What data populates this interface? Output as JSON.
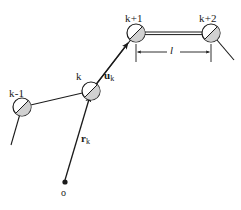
{
  "figure": {
    "type": "chain-link-diagram",
    "width": 241,
    "height": 210,
    "background_color": "#ffffff",
    "stroke_color": "#1a1a1a",
    "bead_fill_color": "#ffffff",
    "bead_shade_color": "#b5b5b5"
  },
  "nodes": [
    {
      "id": "k-1",
      "label": "k-1",
      "cx": 22,
      "cy": 107,
      "r": 9
    },
    {
      "id": "k",
      "label": "k",
      "cx": 91,
      "cy": 91,
      "r": 9
    },
    {
      "id": "k+1",
      "label": "k+1",
      "cx": 136,
      "cy": 33,
      "r": 9
    },
    {
      "id": "k+2",
      "label": "k+2",
      "cx": 211,
      "cy": 33,
      "r": 9
    }
  ],
  "labels": {
    "node_k_minus_1": "k-1",
    "node_k": "k",
    "node_k_plus_1": "k+1",
    "node_k_plus_2": "k+2",
    "unit_vector": "u",
    "unit_vector_sub": "k",
    "position_vector": "r",
    "position_vector_sub": "k",
    "bond_length": "l",
    "origin": "o"
  },
  "vectors": {
    "u_k": {
      "from": "k",
      "to": "k+1",
      "label": "u",
      "subscript": "k",
      "arrow": true
    },
    "r_k": {
      "from": "o",
      "to": "k",
      "label": "r",
      "subscript": "k",
      "arrow": true
    }
  },
  "dimension": {
    "label": "l",
    "from_node": "k+1",
    "to_node": "k+2",
    "y": 52,
    "x_start": 136,
    "x_end": 211,
    "arrow_direction": "outward"
  },
  "origin_marker": {
    "label": "o",
    "cx": 65,
    "cy": 182,
    "r": 2.6,
    "filled": true
  }
}
